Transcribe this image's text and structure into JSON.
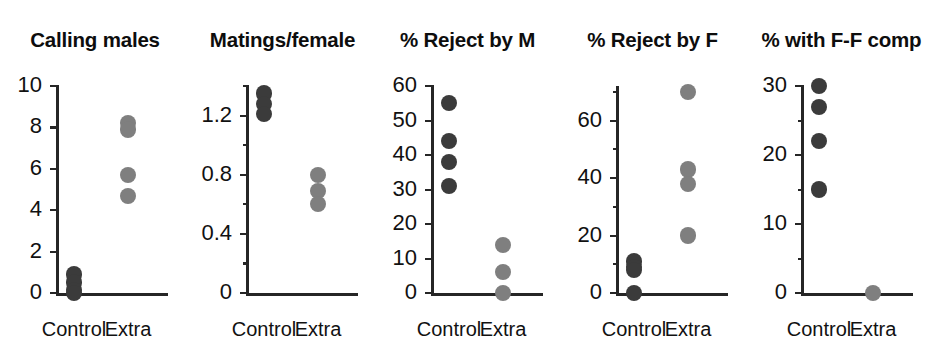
{
  "figure": {
    "width": 938,
    "height": 356,
    "background": "#ffffff",
    "group_labels": [
      "Control",
      "Extra"
    ],
    "colors": {
      "control_dot": "#3b3b3b",
      "extra_dot": "#7f7f7f",
      "axis": "#262626",
      "text": "#111111"
    }
  },
  "chart_data": [
    {
      "type": "scatter",
      "title": "Calling males",
      "xlabel": "",
      "ylabel": "",
      "categories": [
        "Control",
        "Extra"
      ],
      "ylim": [
        0,
        10
      ],
      "yticks": [
        0,
        2,
        4,
        6,
        8,
        10
      ],
      "ytick_labels": [
        "0",
        "2",
        "4",
        "6",
        "8",
        "10"
      ],
      "grid": false,
      "legend": "none",
      "series": [
        {
          "name": "Control",
          "values": [
            0.9,
            0.5,
            0.15,
            0.0
          ]
        },
        {
          "name": "Extra",
          "values": [
            8.2,
            7.9,
            5.7,
            4.7
          ]
        }
      ]
    },
    {
      "type": "scatter",
      "title": "Matings/female",
      "xlabel": "",
      "ylabel": "",
      "categories": [
        "Control",
        "Extra"
      ],
      "ylim": [
        0,
        1.4
      ],
      "yticks": [
        0,
        0.2,
        0.4,
        0.6,
        0.8,
        1.0,
        1.2,
        1.4
      ],
      "ytick_labels": [
        "0",
        "",
        "0.4",
        "",
        "0.8",
        "",
        "1.2",
        ""
      ],
      "grid": false,
      "legend": "none",
      "series": [
        {
          "name": "Control",
          "values": [
            1.35,
            1.28,
            1.21
          ]
        },
        {
          "name": "Extra",
          "values": [
            0.8,
            0.69,
            0.6
          ]
        }
      ]
    },
    {
      "type": "scatter",
      "title": "% Reject by M",
      "xlabel": "",
      "ylabel": "",
      "categories": [
        "Control",
        "Extra"
      ],
      "ylim": [
        0,
        60
      ],
      "yticks": [
        0,
        10,
        20,
        30,
        40,
        50,
        60
      ],
      "ytick_labels": [
        "0",
        "10",
        "20",
        "30",
        "40",
        "50",
        "60"
      ],
      "grid": false,
      "legend": "none",
      "series": [
        {
          "name": "Control",
          "values": [
            55,
            44,
            38,
            31
          ]
        },
        {
          "name": "Extra",
          "values": [
            14,
            6,
            0
          ]
        }
      ]
    },
    {
      "type": "scatter",
      "title": "% Reject by F",
      "xlabel": "",
      "ylabel": "",
      "categories": [
        "Control",
        "Extra"
      ],
      "ylim": [
        0,
        72
      ],
      "yticks": [
        0,
        10,
        20,
        30,
        40,
        50,
        60,
        70
      ],
      "ytick_labels": [
        "0",
        "",
        "20",
        "",
        "40",
        "",
        "60",
        ""
      ],
      "grid": false,
      "legend": "none",
      "series": [
        {
          "name": "Control",
          "values": [
            11,
            9,
            8,
            0
          ]
        },
        {
          "name": "Extra",
          "values": [
            70,
            43,
            38,
            20
          ]
        }
      ]
    },
    {
      "type": "scatter",
      "title": "% with F-F comp",
      "xlabel": "",
      "ylabel": "",
      "categories": [
        "Control",
        "Extra"
      ],
      "ylim": [
        0,
        30
      ],
      "yticks": [
        0,
        5,
        10,
        15,
        20,
        25,
        30
      ],
      "ytick_labels": [
        "0",
        "",
        "10",
        "",
        "20",
        "",
        "30"
      ],
      "grid": false,
      "legend": "none",
      "series": [
        {
          "name": "Control",
          "values": [
            30,
            27,
            22,
            15
          ]
        },
        {
          "name": "Extra",
          "values": [
            0
          ]
        }
      ]
    }
  ]
}
